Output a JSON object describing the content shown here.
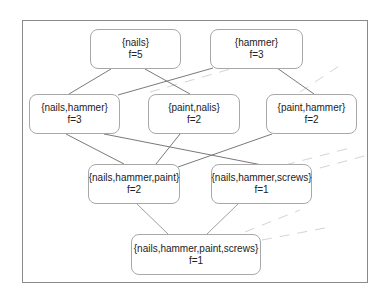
{
  "diagram": {
    "type": "itemset-lattice",
    "colors": {
      "frame": "#8a8a8a",
      "node_border": "#a8a8a8",
      "edge": "#7a7a7a",
      "dashed": "#d0d0d0",
      "text": "#222222"
    },
    "nodes": [
      {
        "id": "n1",
        "itemset": "{nails}",
        "freq": "f=5"
      },
      {
        "id": "n2",
        "itemset": "{hammer}",
        "freq": "f=3"
      },
      {
        "id": "n3",
        "itemset": "{nails,hammer}",
        "freq": "f=3"
      },
      {
        "id": "n4",
        "itemset": "{paint,nalis}",
        "freq": "f=2"
      },
      {
        "id": "n5",
        "itemset": "{paint,hammer}",
        "freq": "f=2"
      },
      {
        "id": "n6",
        "itemset": "{nails,hammer,paint}",
        "freq": "f=2"
      },
      {
        "id": "n7",
        "itemset": "{nails,hammer,screws}",
        "freq": "f=1"
      },
      {
        "id": "n8",
        "itemset": "{nails,hammer,paint,screws}",
        "freq": "f=1"
      }
    ],
    "edges": [
      [
        "n1",
        "n3"
      ],
      [
        "n1",
        "n4"
      ],
      [
        "n2",
        "n3"
      ],
      [
        "n2",
        "n5"
      ],
      [
        "n3",
        "n6"
      ],
      [
        "n3",
        "n7"
      ],
      [
        "n4",
        "n6"
      ],
      [
        "n5",
        "n6"
      ],
      [
        "n6",
        "n8"
      ],
      [
        "n7",
        "n8"
      ]
    ]
  }
}
